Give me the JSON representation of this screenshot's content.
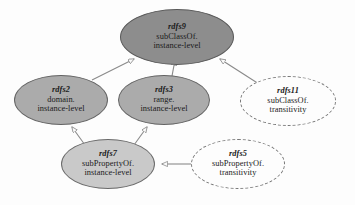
{
  "diagram": {
    "type": "rdfs-rule-dependency-graph",
    "background_color": "#fdfdfd",
    "nodes": [
      {
        "id": "rdfs9",
        "label": "rdfs9",
        "line2": "subClassOf.",
        "line3": "instance-level",
        "style": "solid",
        "fill": "#8d8d8d",
        "stroke": "#595959",
        "cx": 177,
        "cy": 37,
        "rx": 57,
        "ry": 28
      },
      {
        "id": "rdfs2",
        "label": "rdfs2",
        "line2": "domain.",
        "line3": "instance-level",
        "style": "solid",
        "fill": "#ababab",
        "stroke": "#636363",
        "cx": 61,
        "cy": 100,
        "rx": 47,
        "ry": 25
      },
      {
        "id": "rdfs3",
        "label": "rdfs3",
        "line2": "range.",
        "line3": "instance-level",
        "style": "solid",
        "fill": "#ababab",
        "stroke": "#636363",
        "cx": 164,
        "cy": 100,
        "rx": 46,
        "ry": 25
      },
      {
        "id": "rdfs11",
        "label": "rdfs11",
        "line2": "subClassOf.",
        "line3": "transitivity",
        "style": "dashed",
        "fill": "#fdfdfd",
        "stroke": "#777777",
        "cx": 288,
        "cy": 101,
        "rx": 48,
        "ry": 25
      },
      {
        "id": "rdfs7",
        "label": "rdfs7",
        "line2": "subPropertyOf.",
        "line3": "instance-level",
        "style": "solid",
        "fill": "#c9c9c9",
        "stroke": "#6a6a6a",
        "cx": 108,
        "cy": 164,
        "rx": 47,
        "ry": 25
      },
      {
        "id": "rdfs5",
        "label": "rdfs5",
        "line2": "subPropertyOf.",
        "line3": "transitivity",
        "style": "dashed",
        "fill": "#fdfdfd",
        "stroke": "#777777",
        "cx": 238,
        "cy": 164,
        "rx": 47,
        "ry": 25
      }
    ],
    "edges": [
      {
        "from": "rdfs2",
        "to": "rdfs9",
        "arrow": "to",
        "style": "solid"
      },
      {
        "from": "rdfs3",
        "to": "rdfs9",
        "arrow": "to",
        "style": "solid"
      },
      {
        "from": "rdfs11",
        "to": "rdfs9",
        "arrow": "to",
        "style": "solid"
      },
      {
        "from": "rdfs7",
        "to": "rdfs2",
        "arrow": "to",
        "style": "solid"
      },
      {
        "from": "rdfs7",
        "to": "rdfs3",
        "arrow": "to",
        "style": "solid"
      },
      {
        "from": "rdfs5",
        "to": "rdfs7",
        "arrow": "to",
        "style": "solid"
      }
    ],
    "edge_color": "#8a8a8a"
  }
}
